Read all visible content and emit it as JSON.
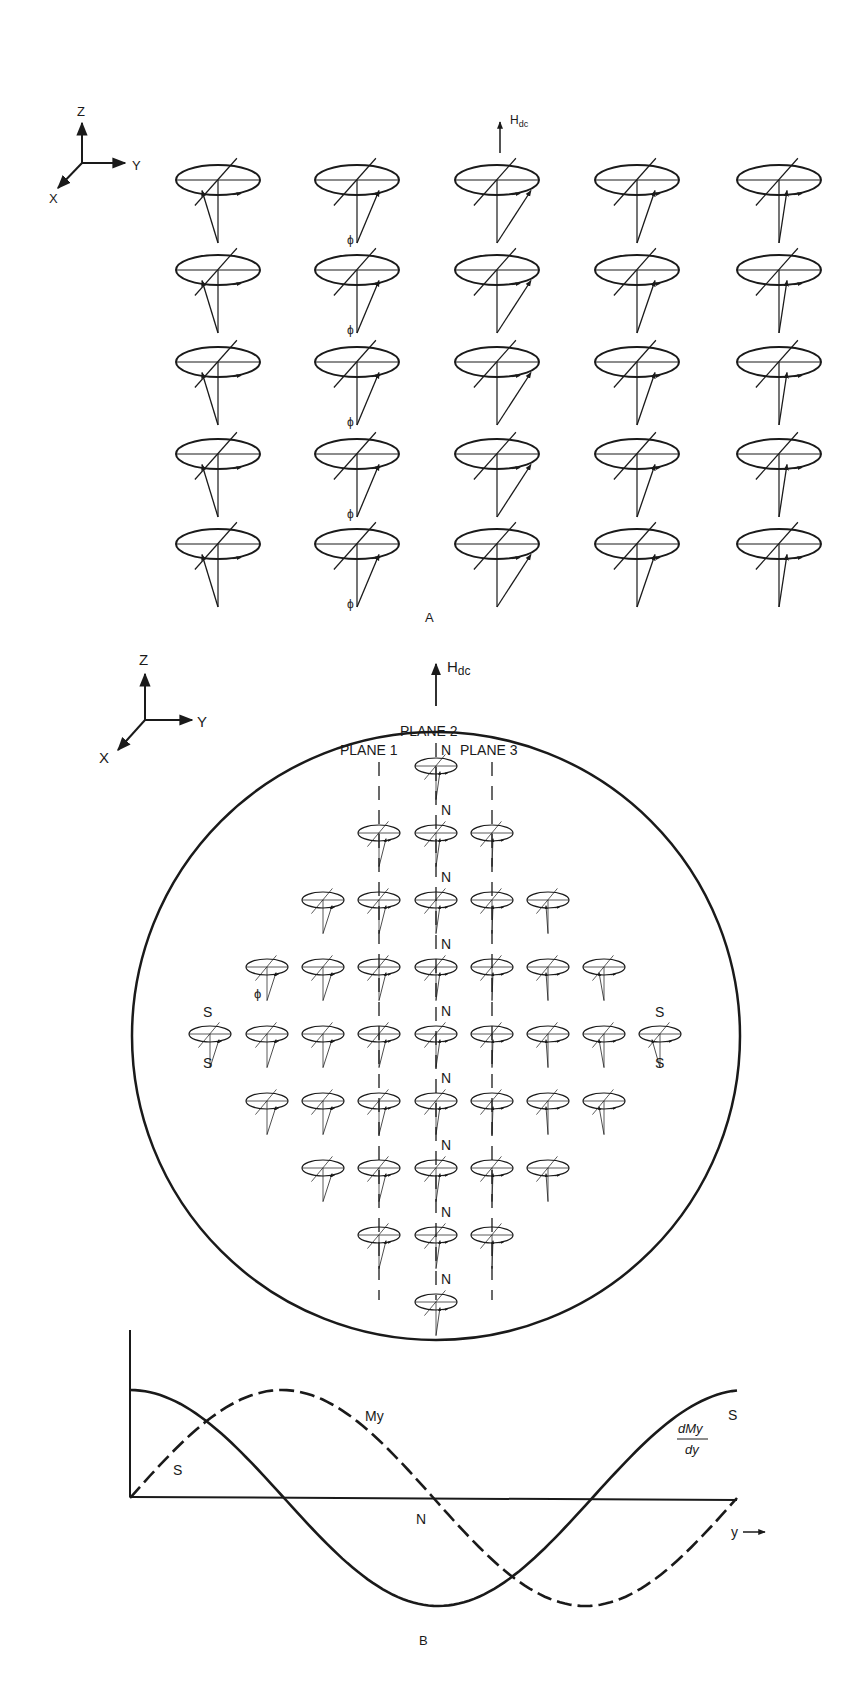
{
  "panel_a": {
    "caption": "A",
    "field_label_main": "H",
    "field_label_sub": "dc",
    "axes": {
      "z": "Z",
      "y": "Y",
      "x": "X"
    },
    "angle_symbol": "ϕ",
    "grid": {
      "rows": 5,
      "cols": 5
    }
  },
  "panel_b": {
    "caption": "B",
    "field_label_main": "H",
    "field_label_sub": "dc",
    "axes": {
      "z": "Z",
      "y": "Y",
      "x": "X"
    },
    "plane_labels": {
      "plane1": "PLANE 1",
      "plane2": "PLANE 2",
      "plane3": "PLANE 3"
    },
    "north": "N",
    "south": "S",
    "angle_symbol": "ϕ",
    "row_counts": [
      1,
      3,
      5,
      7,
      9,
      7,
      5,
      3,
      1
    ]
  },
  "chart_data": {
    "type": "line",
    "title": "",
    "xlabel": "y →",
    "ylabel": "",
    "series": [
      {
        "name": "My",
        "style": "dashed",
        "description": "sine-like, starts at 0, peaks near 1/4, crosses zero at N, minimum near 3/4, returns to 0",
        "x": [
          0,
          0.25,
          0.5,
          0.75,
          1.0
        ],
        "values": [
          0,
          1,
          0,
          -1,
          0
        ]
      },
      {
        "name": "dMy/dy",
        "style": "solid",
        "description": "cosine-like, starts at max, crosses zero near 1/4, minimum at N, crosses zero near 3/4, back to max at S",
        "x": [
          0,
          0.25,
          0.5,
          0.75,
          1.0
        ],
        "values": [
          1,
          0,
          -1,
          0,
          1
        ]
      }
    ],
    "annotations": [
      "S",
      "My",
      "N",
      "dMy/dy",
      "S"
    ],
    "grid": false
  },
  "chart_labels": {
    "my": "My",
    "dmy_num": "dMy",
    "dmy_den": "dy",
    "s_left": "S",
    "s_right": "S",
    "n_mid": "N",
    "y_axis": "y"
  }
}
